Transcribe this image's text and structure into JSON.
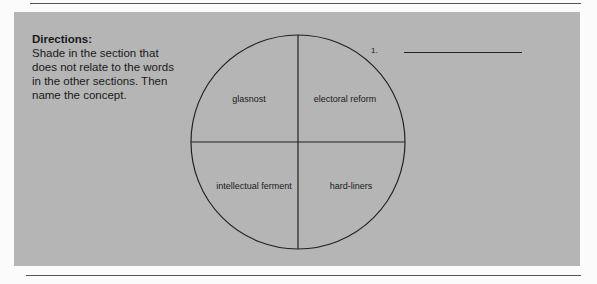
{
  "directions": {
    "title": "Directions:",
    "text": "Shade in the section that does not relate to the words in the other sections. Then name the concept."
  },
  "diagram": {
    "type": "four-section circle",
    "sections": [
      {
        "position": "top-left",
        "label": "glasnost"
      },
      {
        "position": "top-right",
        "label": "electoral reform"
      },
      {
        "position": "bottom-left",
        "label": "intellectual ferment"
      },
      {
        "position": "bottom-right",
        "label": "hard-liners"
      }
    ]
  },
  "answers": [
    {
      "number": "1.",
      "value": ""
    }
  ]
}
